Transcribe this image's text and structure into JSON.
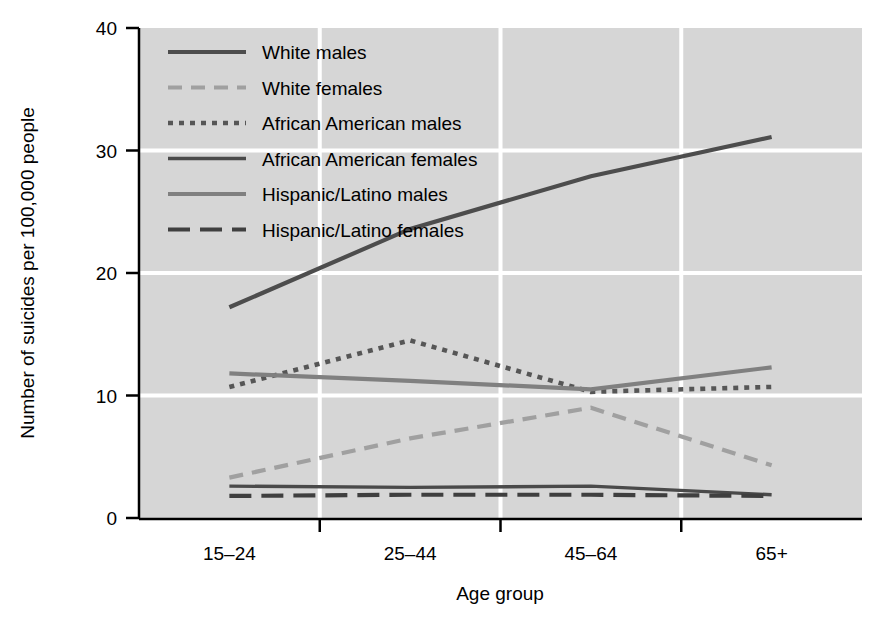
{
  "chart_data": {
    "type": "line",
    "title": "",
    "xlabel": "Age group",
    "ylabel": "Number of suicides per 100,000 people",
    "categories": [
      "15–24",
      "25–44",
      "45–64",
      "65+"
    ],
    "ylim": [
      0,
      40
    ],
    "yticks": [
      0,
      10,
      20,
      30,
      40
    ],
    "ytick_labels": [
      "0",
      "10",
      "20",
      "30",
      "40"
    ],
    "grid": "horizontal-and-vertical-white-gridlines",
    "legend_position": "top-left-inside",
    "plot_background": "#d6d6d6",
    "gridline_color": "#ffffff",
    "series": [
      {
        "name": "White males",
        "values": [
          17.2,
          23.6,
          27.9,
          31.1
        ],
        "color": "#4d4d4d",
        "dash": "none",
        "width": 4.2
      },
      {
        "name": "White females",
        "values": [
          3.3,
          6.5,
          9.0,
          4.3
        ],
        "color": "#a0a0a0",
        "dash": "14,9",
        "width": 4.2
      },
      {
        "name": "African American males",
        "values": [
          10.7,
          14.5,
          10.3,
          10.7
        ],
        "color": "#565656",
        "dash": "5,6",
        "width": 4.6
      },
      {
        "name": "African American females",
        "values": [
          2.6,
          2.5,
          2.6,
          1.9
        ],
        "color": "#4a4a4a",
        "dash": "none",
        "width": 3.4
      },
      {
        "name": "Hispanic/Latino males",
        "values": [
          11.8,
          11.2,
          10.5,
          12.3
        ],
        "color": "#808080",
        "dash": "none",
        "width": 4.2
      },
      {
        "name": "Hispanic/Latino females",
        "values": [
          1.8,
          1.9,
          1.9,
          1.8
        ],
        "color": "#3f3f3f",
        "dash": "22,10",
        "width": 4.2
      }
    ]
  },
  "legend": {
    "items": [
      "White males",
      "White females",
      "African American males",
      "African American females",
      "Hispanic/Latino males",
      "Hispanic/Latino females"
    ]
  },
  "axes": {
    "y_label": "Number of suicides per 100,000 people",
    "x_label": "Age group",
    "y_ticks": [
      "40",
      "30",
      "20",
      "10",
      "0"
    ],
    "x_ticks": [
      "15–24",
      "25–44",
      "45–64",
      "65+"
    ]
  }
}
